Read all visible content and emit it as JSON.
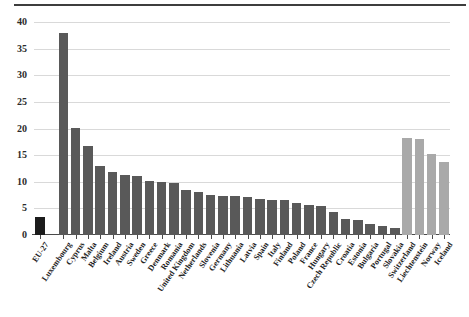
{
  "chart_data": {
    "type": "bar",
    "title": "",
    "subtitle": "",
    "xlabel": "",
    "ylabel": "",
    "ylim": [
      0,
      40
    ],
    "yticks": [
      0,
      5,
      10,
      15,
      20,
      25,
      30,
      35,
      40
    ],
    "ytick_labels": [
      "0",
      "5",
      "10",
      "15",
      "20",
      "25",
      "30",
      "35",
      "40"
    ],
    "grid": true,
    "legend": "none",
    "categories": [
      "EU-27",
      "Luxembourg",
      "Cyprus",
      "Malta",
      "Belgium",
      "Ireland",
      "Austria",
      "Sweden",
      "Greece",
      "Denmark",
      "Romania",
      "United Kingdom",
      "Netherlands",
      "Slovenia",
      "Germany",
      "Lithuania",
      "Latvia",
      "Spain",
      "Italy",
      "Finland",
      "Poland",
      "France",
      "Hungary",
      "Czech Republic",
      "Croatia",
      "Estonia",
      "Bulgaria",
      "Portugal",
      "Slovakia",
      "Switzerland",
      "Liechtenstein",
      "Norway",
      "Iceland"
    ],
    "values": [
      3.3,
      38.0,
      20.1,
      16.8,
      13.0,
      11.8,
      11.3,
      11.1,
      10.1,
      9.9,
      9.8,
      8.5,
      8.0,
      7.6,
      7.4,
      7.3,
      7.2,
      6.7,
      6.6,
      6.5,
      6.0,
      5.6,
      5.5,
      4.4,
      3.1,
      2.9,
      2.1,
      1.7,
      1.3,
      18.2,
      18.0,
      15.2,
      13.7
    ],
    "bar_colors": [
      "black",
      "dark",
      "dark",
      "dark",
      "dark",
      "dark",
      "dark",
      "dark",
      "dark",
      "dark",
      "dark",
      "dark",
      "dark",
      "dark",
      "dark",
      "dark",
      "dark",
      "dark",
      "dark",
      "dark",
      "dark",
      "dark",
      "dark",
      "dark",
      "dark",
      "dark",
      "dark",
      "dark",
      "dark",
      "light",
      "light",
      "light",
      "light"
    ],
    "colors": {
      "aggregate": "#1c1c1c",
      "member_state": "#595959",
      "efta": "#a9a9a9",
      "gridline": "#d9d9d9",
      "axis": "#4a4a4a"
    },
    "gap_after_index": 0
  }
}
